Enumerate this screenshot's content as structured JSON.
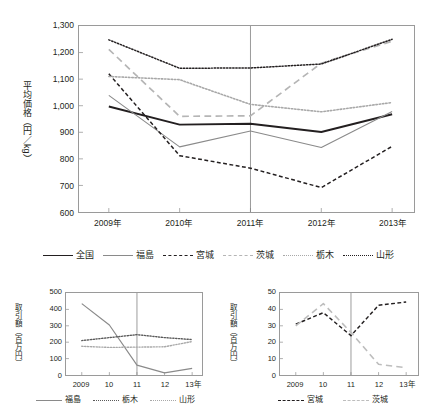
{
  "chart_data": [
    {
      "id": "main",
      "type": "line",
      "title": "",
      "xlabel": "",
      "ylabel": "平均価格（円／kg）",
      "categories": [
        "2009年",
        "2010年",
        "2011年",
        "2012年",
        "2013年"
      ],
      "ylim": [
        600,
        1300
      ],
      "yticks": [
        "600",
        "700",
        "800",
        "900",
        "1,000",
        "1,100",
        "1,200",
        "1,300"
      ],
      "ytick_values": [
        600,
        700,
        800,
        900,
        1000,
        1100,
        1200,
        1300
      ],
      "grid": false,
      "legend_position": "bottom",
      "reference_line": {
        "x": "2011年",
        "color": "#808080"
      },
      "series": [
        {
          "name": "全国",
          "values": [
            997,
            929,
            932,
            901,
            968
          ],
          "color": "#231f20",
          "style": "solid",
          "width": 1.9
        },
        {
          "name": "福島",
          "values": [
            1039,
            845,
            905,
            843,
            978
          ],
          "color": "#8a8a8a",
          "style": "solid",
          "width": 1.1
        },
        {
          "name": "宮城",
          "values": [
            1120,
            812,
            765,
            692,
            847
          ],
          "color": "#231f20",
          "style": "dashed",
          "width": 1.5
        },
        {
          "name": "茨城",
          "values": [
            1212,
            960,
            962,
            1160,
            1243
          ],
          "color": "#b5b5b5",
          "style": "longdash",
          "width": 1.7
        },
        {
          "name": "栃木",
          "values": [
            1110,
            1098,
            1005,
            977,
            1012
          ],
          "color": "#a8a8a8",
          "style": "dotted",
          "width": 1.6
        },
        {
          "name": "山形",
          "values": [
            1248,
            1141,
            1142,
            1157,
            1250
          ],
          "color": "#231f20",
          "style": "dotted",
          "width": 1.5
        }
      ]
    },
    {
      "id": "sub-left",
      "type": "line",
      "title": "",
      "xlabel": "",
      "ylabel": "取引額（百万円）",
      "categories": [
        "2009",
        "10",
        "11",
        "12",
        "13年"
      ],
      "ylim": [
        0,
        500
      ],
      "yticks": [
        "0",
        "100",
        "200",
        "300",
        "400",
        "500"
      ],
      "ytick_values": [
        0,
        100,
        200,
        300,
        400,
        500
      ],
      "grid": false,
      "legend_position": "bottom",
      "reference_line": {
        "x": "11",
        "color": "#808080"
      },
      "series": [
        {
          "name": "福島",
          "values": [
            435,
            305,
            60,
            13,
            40
          ],
          "color": "#8a8a8a",
          "style": "solid",
          "width": 1.2
        },
        {
          "name": "栃木",
          "values": [
            210,
            228,
            246,
            228,
            216
          ],
          "color": "#5a5a5a",
          "style": "dotted",
          "width": 1.4
        },
        {
          "name": "山形",
          "values": [
            175,
            168,
            170,
            172,
            204
          ],
          "color": "#a8a8a8",
          "style": "dotted",
          "width": 1.4
        }
      ]
    },
    {
      "id": "sub-right",
      "type": "line",
      "title": "",
      "xlabel": "",
      "ylabel": "取引額（百万円）",
      "categories": [
        "2009",
        "10",
        "11",
        "12",
        "13年"
      ],
      "ylim": [
        0,
        50
      ],
      "yticks": [
        "0",
        "10",
        "20",
        "30",
        "40",
        "50"
      ],
      "ytick_values": [
        0,
        10,
        20,
        30,
        40,
        50
      ],
      "grid": false,
      "legend_position": "bottom",
      "reference_line": {
        "x": "11",
        "color": "#808080"
      },
      "series": [
        {
          "name": "宮城",
          "values": [
            31,
            38,
            24,
            42.5,
            44.5
          ],
          "color": "#231f20",
          "style": "dashed",
          "width": 1.5
        },
        {
          "name": "茨城",
          "values": [
            30,
            43.5,
            26,
            6.5,
            4.5
          ],
          "color": "#bdbdbd",
          "style": "longdash",
          "width": 1.6
        }
      ]
    }
  ],
  "main": {
    "ylabel": "平均価格（円／kg）",
    "legend": [
      {
        "label": "全国"
      },
      {
        "label": "福島"
      },
      {
        "label": "宮城"
      },
      {
        "label": "茨城"
      },
      {
        "label": "栃木"
      },
      {
        "label": "山形"
      }
    ]
  },
  "sub_left": {
    "ylabel": "取引額（百万円）",
    "legend": [
      {
        "label": "福島"
      },
      {
        "label": "栃木"
      },
      {
        "label": "山形"
      }
    ]
  },
  "sub_right": {
    "ylabel": "取引額（百万円）",
    "legend": [
      {
        "label": "宮城"
      },
      {
        "label": "茨城"
      }
    ]
  }
}
